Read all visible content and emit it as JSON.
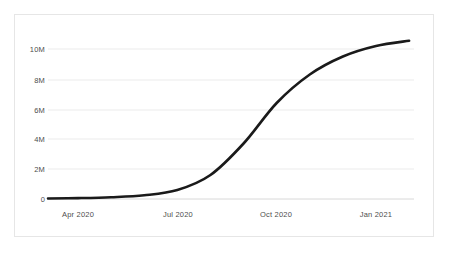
{
  "chart_data": {
    "type": "line",
    "title": "",
    "subtitle": "",
    "xlabel": "",
    "ylabel": "",
    "grid": true,
    "legend": "none",
    "line_color": "#1a1a1a",
    "grid_color": "#ebebeb",
    "axis_color": "#1a1a1a",
    "text_color": "#4d4d4d",
    "background": "#ffffff",
    "ylim": [
      0,
      11000000
    ],
    "y_ticks": [
      {
        "value": 0,
        "label": "0"
      },
      {
        "value": 2000000,
        "label": "2M"
      },
      {
        "value": 4000000,
        "label": "4M"
      },
      {
        "value": 6000000,
        "label": "6M"
      },
      {
        "value": 8000000,
        "label": "8M"
      },
      {
        "value": 10000000,
        "label": "10M"
      }
    ],
    "x_ticks": [
      {
        "position": 1,
        "label": "Apr 2020"
      },
      {
        "position": 4,
        "label": "Jul 2020"
      },
      {
        "position": 7,
        "label": "Oct 2020"
      },
      {
        "position": 10,
        "label": "Jan 2021"
      }
    ],
    "x": [
      "Mar 2020",
      "Apr 2020",
      "May 2020",
      "Jun 2020",
      "Jul 2020",
      "Aug 2020",
      "Sep 2020",
      "Oct 2020",
      "Nov 2020",
      "Dec 2020",
      "Jan 2021",
      "Feb 2021"
    ],
    "series": [
      {
        "name": "Cumulative total",
        "values": [
          30000,
          60000,
          120000,
          250000,
          600000,
          1600000,
          3700000,
          6400000,
          8300000,
          9500000,
          10200000,
          10550000
        ]
      }
    ]
  }
}
